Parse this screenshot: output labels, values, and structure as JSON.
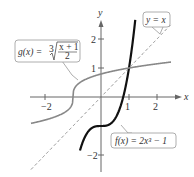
{
  "chart_data": {
    "type": "line",
    "title": "",
    "xlabel": "x",
    "ylabel": "y",
    "xlim": [
      -2.7,
      2.7
    ],
    "ylim": [
      -2.6,
      2.6
    ],
    "grid": false,
    "x_ticks": [
      {
        "value": -2,
        "label": "−2"
      },
      {
        "value": 1,
        "label": "1"
      },
      {
        "value": 2,
        "label": "2"
      }
    ],
    "y_ticks": [
      {
        "value": 2,
        "label": "2"
      },
      {
        "value": 1,
        "label": "1"
      },
      {
        "value": -2,
        "label": "−2"
      }
    ],
    "series": [
      {
        "name": "f",
        "expression": "f(x) = 2x^3 - 1",
        "label": "f(x) = 2x³ − 1",
        "color": "#111111",
        "style": "solid-bold",
        "domain": [
          -0.75,
          1.32
        ]
      },
      {
        "name": "g",
        "expression": "g(x) = cbrt((x+1)/2)",
        "label_prefix": "g(x) = ",
        "label_num": "x + 1",
        "label_den": "2",
        "color": "#888888",
        "style": "solid",
        "domain": [
          -2.5,
          2.5
        ]
      },
      {
        "name": "identity",
        "expression": "y = x",
        "label": "y = x",
        "color": "#888888",
        "style": "dashed",
        "domain": [
          -2.5,
          2.5
        ]
      }
    ],
    "intersections": [
      {
        "x": 1,
        "y": 1
      }
    ]
  }
}
